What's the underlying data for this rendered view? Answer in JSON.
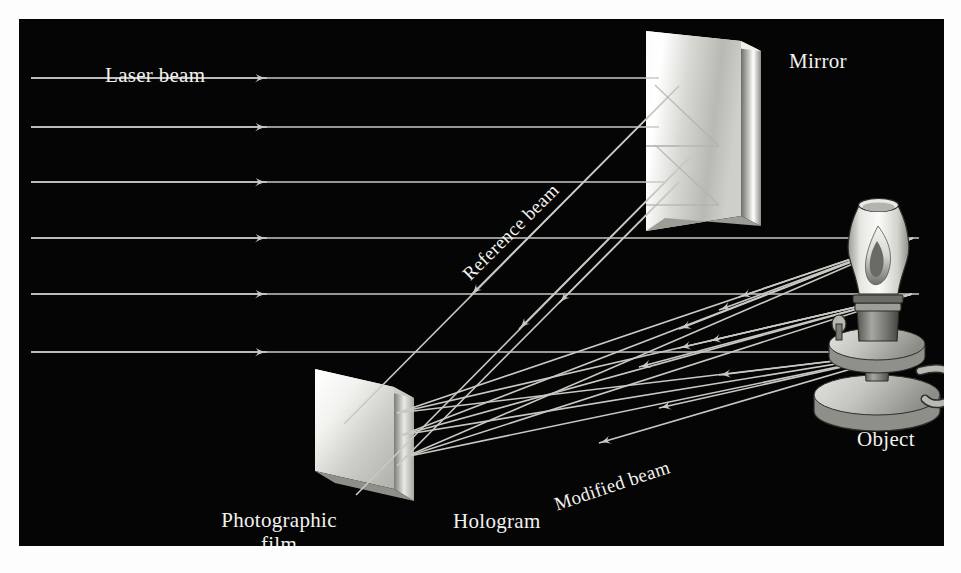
{
  "figure": {
    "kind": "holography-setup-diagram",
    "background_color": "#050505",
    "page_color": "#fdfdfd",
    "line_color": "#c9c9c4",
    "text_color": "#f2f2ee"
  },
  "labels": {
    "laser_beam": "Laser beam",
    "mirror": "Mirror",
    "reference_beam": "Reference beam",
    "modified_beam": "Modified beam",
    "object": "Object",
    "hologram": "Hologram",
    "photographic_film_line1": "Photographic",
    "photographic_film_line2": "film"
  },
  "objects": {
    "mirror": {
      "name": "Mirror",
      "shape": "tilted-rectangular-slab",
      "fill": "#e8e8e4"
    },
    "film": {
      "name": "Photographic film / Hologram",
      "shape": "tilted-rectangular-slab",
      "fill": "#ececeA"
    },
    "lamp": {
      "name": "Oil lamp object",
      "parts": [
        "glass-chimney",
        "flame",
        "burner",
        "collar",
        "base",
        "handle"
      ]
    }
  },
  "beams": {
    "laser_rows_y": [
      78,
      127,
      182,
      238,
      294,
      352
    ],
    "laser_arrow_x": 248,
    "reference_beam_count": 3,
    "modified_beam_count": 9,
    "object_source_points_y": [
      236,
      299,
      355
    ]
  }
}
